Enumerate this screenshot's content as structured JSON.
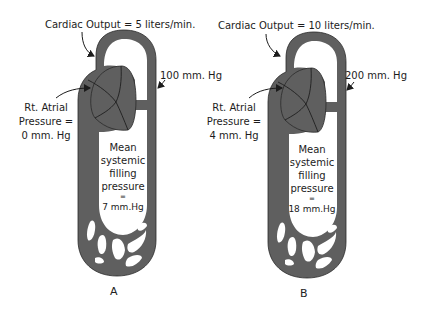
{
  "colors": {
    "vessel": "#5f5f5f",
    "outline": "#2a2a2a",
    "background": "#ffffff",
    "text": "#1c1c1c"
  },
  "panels": [
    {
      "id": "A",
      "letter": "A",
      "cardiac_output": "Cardiac  Output = 5  liters/min.",
      "arterial_pressure": "100 mm. Hg",
      "rt_atrial_line1": "Rt. Atrial",
      "rt_atrial_line2": "Pressure =",
      "rt_atrial_line3": "0 mm. Hg",
      "msfp_line1": "Mean",
      "msfp_line2": "systemic",
      "msfp_line3": "filling",
      "msfp_line4": "pressure",
      "msfp_line5": "=",
      "msfp_line6": "7 mm.Hg"
    },
    {
      "id": "B",
      "letter": "B",
      "cardiac_output": "Cardiac  Output = 10  liters/min.",
      "arterial_pressure": "200 mm. Hg",
      "rt_atrial_line1": "Rt. Atrial",
      "rt_atrial_line2": "Pressure =",
      "rt_atrial_line3": "4 mm. Hg",
      "msfp_line1": "Mean",
      "msfp_line2": "systemic",
      "msfp_line3": "filling",
      "msfp_line4": "pressure",
      "msfp_line5": "=",
      "msfp_line6": "18 mm.Hg"
    }
  ]
}
